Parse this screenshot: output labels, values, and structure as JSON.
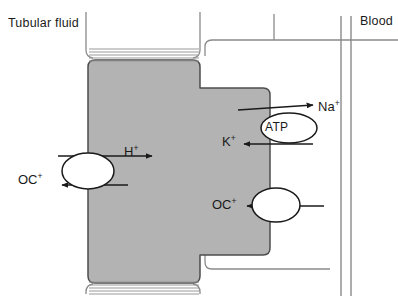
{
  "diagram": {
    "type": "cell-transport-diagram",
    "colors": {
      "cell_fill": "#b3b3b3",
      "cell_outline": "#4d4d4d",
      "membrane_line": "#808080",
      "arrow": "#1a1a1a",
      "text": "#1a1a1a",
      "background": "#ffffff",
      "transporter_fill": "#ffffff"
    },
    "regions": [
      {
        "id": "tubular-fluid",
        "label": "Tubular fluid",
        "side": "left"
      },
      {
        "id": "blood",
        "label": "Blood",
        "side": "right"
      }
    ],
    "cell": {
      "name": "epithelial-cell",
      "shape": "stepped-cross",
      "brush_border_stripes": 5
    },
    "transporters": [
      {
        "id": "apical-exchanger",
        "shape": "oval",
        "label": "",
        "membrane": "apical",
        "arrows": [
          {
            "ion": "H",
            "charge": "+",
            "direction": "right",
            "label": "H"
          },
          {
            "ion": "OC",
            "charge": "+",
            "direction": "left",
            "label": "OC"
          }
        ]
      },
      {
        "id": "sodium-potassium-atpase",
        "shape": "oval",
        "label": "ATP",
        "membrane": "basolateral",
        "arrows": [
          {
            "ion": "Na",
            "charge": "+",
            "direction": "right",
            "label": "Na"
          },
          {
            "ion": "K",
            "charge": "+",
            "direction": "left",
            "label": "K"
          }
        ]
      },
      {
        "id": "basolateral-oc-transporter",
        "shape": "oval",
        "label": "",
        "membrane": "basolateral",
        "arrows": [
          {
            "ion": "OC",
            "charge": "+",
            "direction": "left",
            "label": "OC"
          }
        ]
      }
    ],
    "labels": {
      "tubular_fluid": "Tubular fluid",
      "blood": "Blood",
      "atp": "ATP",
      "h_ion": "H",
      "h_charge": "+",
      "oc_apical": "OC",
      "oc_apical_charge": "+",
      "na_ion": "Na",
      "na_charge": "+",
      "k_ion": "K",
      "k_charge": "+",
      "oc_baso": "OC",
      "oc_baso_charge": "+"
    }
  }
}
